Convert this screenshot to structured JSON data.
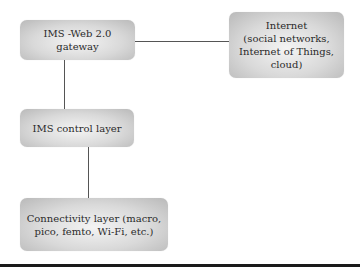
{
  "diagram": {
    "nodes": [
      {
        "id": "gateway",
        "label": "IMS -Web 2.0\ngateway"
      },
      {
        "id": "internet",
        "label": "Internet\n(social networks,\nInternet of Things, cloud)"
      },
      {
        "id": "control",
        "label": "IMS control layer"
      },
      {
        "id": "connectivity",
        "label": "Connectivity layer (macro,\npico, femto, Wi-Fi, etc.)"
      }
    ],
    "edges": [
      {
        "from": "gateway",
        "to": "internet"
      },
      {
        "from": "gateway",
        "to": "control"
      },
      {
        "from": "control",
        "to": "connectivity"
      }
    ]
  }
}
